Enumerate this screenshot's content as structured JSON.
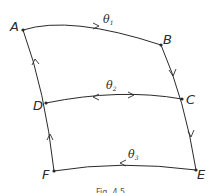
{
  "diagram": {
    "points": [
      {
        "id": "A",
        "x": 23,
        "y": 30,
        "lx": 11,
        "ly": 30
      },
      {
        "id": "B",
        "x": 161,
        "y": 45,
        "lx": 163,
        "ly": 43
      },
      {
        "id": "C",
        "x": 182,
        "y": 99,
        "lx": 186,
        "ly": 103
      },
      {
        "id": "D",
        "x": 46,
        "y": 103,
        "lx": 33,
        "ly": 109
      },
      {
        "id": "E",
        "x": 196,
        "y": 170,
        "lx": 197,
        "ly": 178
      },
      {
        "id": "F",
        "x": 54,
        "y": 171,
        "lx": 42,
        "ly": 178
      }
    ],
    "labels": {
      "A": "A",
      "B": "B",
      "C": "C",
      "D": "D",
      "E": "E",
      "F": "F",
      "theta_top": "θ",
      "theta_top_sub": "1",
      "theta_mid": "θ",
      "theta_mid_sub": "2",
      "theta_bot": "θ",
      "theta_bot_sub": "3"
    },
    "caption": "Fig. 4.5",
    "stroke_color": "#2a2a2a"
  }
}
